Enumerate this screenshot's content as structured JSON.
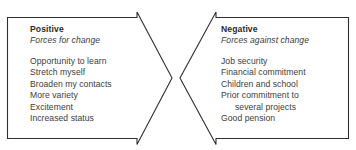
{
  "figure": {
    "type": "force-field-analysis-diagram",
    "top_clipped_text": "",
    "colors": {
      "background": "#ffffff",
      "outline": "#2f2f2f",
      "text": "#3d3d3d",
      "title_text": "#2b2b2b"
    }
  },
  "positive": {
    "title": "Positive",
    "subtitle": "Forces for change",
    "items": [
      {
        "text": "Opportunity to learn",
        "continuation": false
      },
      {
        "text": "Stretch myself",
        "continuation": false
      },
      {
        "text": "Broaden my contacts",
        "continuation": false
      },
      {
        "text": "More variety",
        "continuation": false
      },
      {
        "text": "Excitement",
        "continuation": false
      },
      {
        "text": "Increased status",
        "continuation": false
      }
    ]
  },
  "negative": {
    "title": "Negative",
    "subtitle": "Forces against change",
    "items": [
      {
        "text": "Job security",
        "continuation": false
      },
      {
        "text": "Financial commitment",
        "continuation": false
      },
      {
        "text": "Children and school",
        "continuation": false
      },
      {
        "text": "Prior commitment to",
        "continuation": false
      },
      {
        "text": "several projects",
        "continuation": true
      },
      {
        "text": "Good pension",
        "continuation": false
      }
    ]
  }
}
